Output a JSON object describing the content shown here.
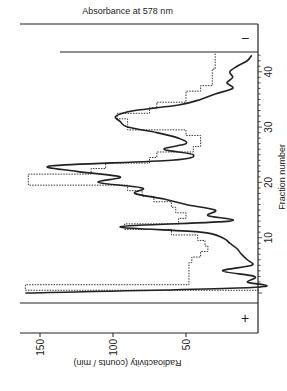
{
  "chart_data": {
    "type": "line",
    "orientation": "rotated 90deg counter-clockwise",
    "title": "",
    "xlabel": "Fraction number",
    "ylabel": "Radioactivity  (counts / min)",
    "y2label": "Absorbance  at  578 nm",
    "xlim": [
      0,
      43
    ],
    "ylim": [
      0,
      165
    ],
    "x_ticks": [
      10,
      20,
      30,
      40
    ],
    "y_ticks": [
      50,
      100,
      150
    ],
    "grid": false,
    "annotations": [
      {
        "text": "+",
        "position": "anode end (before fraction 0)"
      },
      {
        "text": "−",
        "position": "cathode end (after fraction 43)"
      }
    ],
    "series": [
      {
        "name": "Radioactivity (histogram)",
        "style": "dashed-step",
        "x": [
          1,
          2,
          3,
          4,
          5,
          6,
          7,
          8,
          9,
          10,
          11,
          12,
          13,
          14,
          15,
          16,
          17,
          18,
          19,
          20,
          21,
          22,
          23,
          24,
          25,
          26,
          27,
          28,
          29,
          30,
          31,
          32,
          33,
          34,
          35,
          36,
          37,
          38,
          39,
          40,
          41,
          42,
          43
        ],
        "values": [
          160,
          48,
          48,
          48,
          48,
          46,
          40,
          35,
          37,
          42,
          60,
          92,
          55,
          50,
          57,
          60,
          72,
          80,
          90,
          158,
          158,
          115,
          105,
          75,
          70,
          45,
          40,
          40,
          50,
          90,
          90,
          97,
          75,
          70,
          50,
          50,
          40,
          32,
          32,
          32,
          30,
          30,
          30
        ]
      },
      {
        "name": "Absorbance at 578 nm",
        "style": "solid",
        "x": [
          0,
          1,
          2,
          3,
          4,
          5,
          6,
          7,
          8,
          9,
          10,
          11,
          12,
          13,
          14,
          15,
          16,
          17,
          18,
          19,
          20,
          21,
          22,
          23,
          24,
          25,
          26,
          27,
          28,
          29,
          30,
          31,
          32,
          33,
          34,
          35,
          36,
          37,
          38,
          39,
          40,
          41,
          42,
          43
        ],
        "values": [
          160,
          5,
          8,
          3,
          25,
          5,
          8,
          12,
          15,
          20,
          25,
          40,
          95,
          20,
          35,
          30,
          50,
          65,
          85,
          80,
          110,
          95,
          125,
          142,
          60,
          45,
          65,
          50,
          55,
          70,
          90,
          95,
          98,
          85,
          55,
          40,
          30,
          18,
          22,
          18,
          20,
          15,
          8,
          5
        ]
      }
    ]
  }
}
